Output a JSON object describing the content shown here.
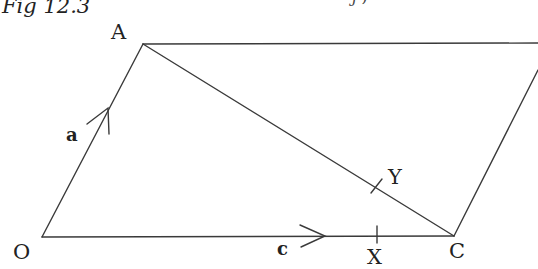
{
  "figure": {
    "caption": "Fig 12.3",
    "top_fragment": "j ,",
    "colors": {
      "line": "#3a3a3a",
      "text": "#222222",
      "background": "#ffffff"
    }
  },
  "points": {
    "A": {
      "label": "A",
      "x": 143,
      "y": 44
    },
    "O": {
      "label": "O",
      "x": 42,
      "y": 237
    },
    "C": {
      "label": "C",
      "x": 454,
      "y": 236
    },
    "X": {
      "label": "X",
      "x": 377,
      "y": 236
    },
    "Y": {
      "label": "Y",
      "x": 375,
      "y": 186
    }
  },
  "vectors": {
    "a": {
      "label": "a",
      "from": "O",
      "to": "A"
    },
    "c": {
      "label": "c",
      "from": "O",
      "to": "C"
    }
  },
  "segments": [
    {
      "name": "OA",
      "from": [
        42,
        237
      ],
      "to": [
        143,
        44
      ]
    },
    {
      "name": "OC",
      "from": [
        42,
        237
      ],
      "to": [
        454,
        236
      ]
    },
    {
      "name": "AC",
      "from": [
        143,
        44
      ],
      "to": [
        454,
        236
      ]
    },
    {
      "name": "A-top",
      "from": [
        143,
        44
      ],
      "to": [
        538,
        43
      ]
    },
    {
      "name": "C-right",
      "from": [
        454,
        236
      ],
      "to": [
        538,
        70
      ]
    }
  ]
}
